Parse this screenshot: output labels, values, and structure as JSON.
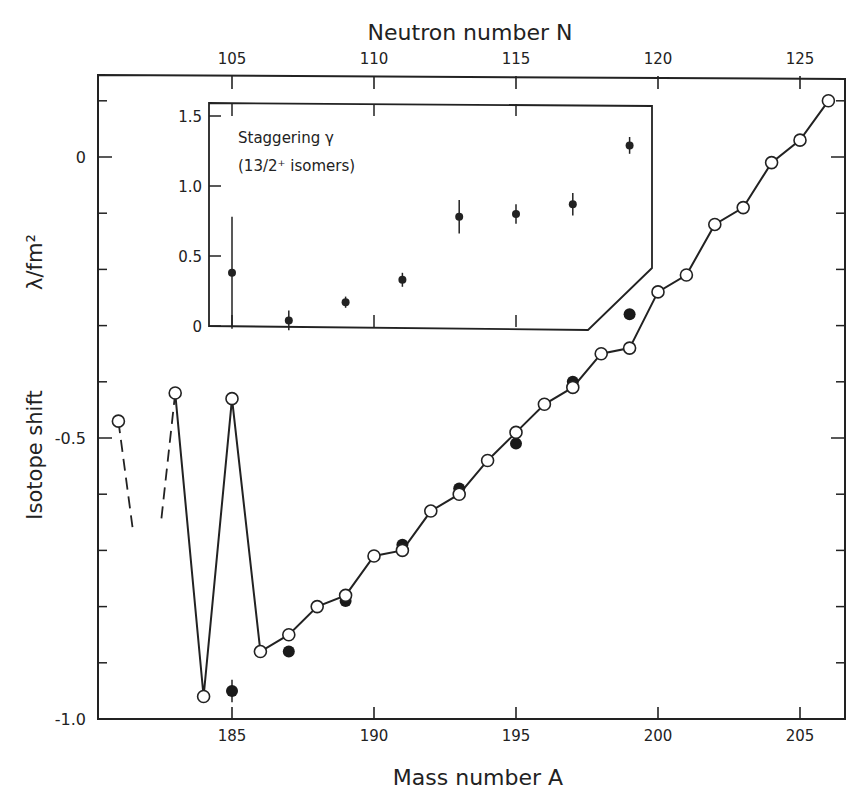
{
  "chart_data": {
    "type": "line",
    "title": "",
    "xlabel": "Mass number A",
    "x2label": "Neutron number N",
    "ylabel": "Isotope shift",
    "ylabel_unit": "λ/fm²",
    "xlim": [
      180.2,
      207
    ],
    "ylim": [
      -1.0,
      0.14
    ],
    "xticks": [
      185,
      190,
      195,
      200,
      205
    ],
    "x2ticks": [
      105,
      110,
      115,
      120,
      125
    ],
    "yticks": [
      0,
      -0.5,
      -1.0
    ],
    "ytick_labels": [
      "0",
      "-0.5",
      "-1.0"
    ],
    "yminor_step": 0.1,
    "grid": false,
    "series": [
      {
        "name": "open (ground states)",
        "marker": "open-circle",
        "points": [
          {
            "x": 181,
            "y": -0.47
          },
          {
            "x": 183,
            "y": -0.42
          },
          {
            "x": 184,
            "y": -0.96
          },
          {
            "x": 185,
            "y": -0.43
          },
          {
            "x": 186,
            "y": -0.88
          },
          {
            "x": 187,
            "y": -0.85
          },
          {
            "x": 188,
            "y": -0.8
          },
          {
            "x": 189,
            "y": -0.78
          },
          {
            "x": 190,
            "y": -0.71
          },
          {
            "x": 191,
            "y": -0.7
          },
          {
            "x": 192,
            "y": -0.63
          },
          {
            "x": 193,
            "y": -0.6
          },
          {
            "x": 194,
            "y": -0.54
          },
          {
            "x": 195,
            "y": -0.49
          },
          {
            "x": 196,
            "y": -0.44
          },
          {
            "x": 197,
            "y": -0.41
          },
          {
            "x": 198,
            "y": -0.35
          },
          {
            "x": 199,
            "y": -0.34
          },
          {
            "x": 200,
            "y": -0.24
          },
          {
            "x": 201,
            "y": -0.21
          },
          {
            "x": 202,
            "y": -0.12
          },
          {
            "x": 203,
            "y": -0.09
          },
          {
            "x": 204,
            "y": -0.01
          },
          {
            "x": 205,
            "y": 0.03
          },
          {
            "x": 206,
            "y": 0.1
          }
        ],
        "dashed_stubs": [
          {
            "from": {
              "x": 181,
              "y": -0.47
            },
            "to": {
              "x": 181.5,
              "y": -0.66
            }
          },
          {
            "from": {
              "x": 183,
              "y": -0.42
            },
            "to": {
              "x": 182.5,
              "y": -0.65
            }
          }
        ]
      },
      {
        "name": "filled (13/2+ isomers)",
        "marker": "filled-circle",
        "points": [
          {
            "x": 185,
            "y": -0.95,
            "err": 0.02
          },
          {
            "x": 187,
            "y": -0.88
          },
          {
            "x": 189,
            "y": -0.79
          },
          {
            "x": 191,
            "y": -0.69
          },
          {
            "x": 193,
            "y": -0.59
          },
          {
            "x": 195,
            "y": -0.51
          },
          {
            "x": 197,
            "y": -0.4
          },
          {
            "x": 199,
            "y": -0.28
          }
        ]
      }
    ],
    "inset": {
      "type": "scatter",
      "title": "Staggering γ",
      "subtitle": "(13/2⁺ isomers)",
      "ylim": [
        0,
        1.6
      ],
      "yticks": [
        0,
        0.5,
        1.0,
        1.5
      ],
      "ytick_labels": [
        "0",
        "0.5",
        "1.0",
        "1.5"
      ],
      "x_axis": "Neutron number N (shared top axis)",
      "points": [
        {
          "N": 105,
          "y": 0.38,
          "err": 0.4
        },
        {
          "N": 107,
          "y": 0.04,
          "err": 0.07
        },
        {
          "N": 109,
          "y": 0.17,
          "err": 0.04
        },
        {
          "N": 111,
          "y": 0.33,
          "err": 0.05
        },
        {
          "N": 113,
          "y": 0.78,
          "err": 0.12
        },
        {
          "N": 115,
          "y": 0.8,
          "err": 0.07
        },
        {
          "N": 117,
          "y": 0.87,
          "err": 0.08
        },
        {
          "N": 119,
          "y": 1.29,
          "err": 0.06
        }
      ]
    }
  },
  "labels": {
    "top_axis_title": "Neutron number N",
    "bottom_axis_title": "Mass number A",
    "y_axis_title": "Isotope shift",
    "y_axis_unit": "λ/fm²",
    "inset_title": "Staggering γ",
    "inset_subtitle": "(13/2⁺ isomers)"
  }
}
